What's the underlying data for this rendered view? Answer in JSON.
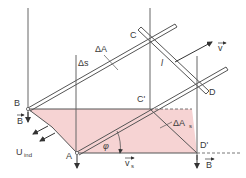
{
  "diagram": {
    "colors": {
      "line": "#555555",
      "area_fill": "#f6d3d3",
      "background": "#ffffff"
    },
    "labels": {
      "point_b": "B",
      "point_a": "A",
      "point_c": "C",
      "point_d": "D",
      "point_c_prime": "C'",
      "point_d_prime": "D'",
      "delta_a": "ΔA",
      "delta_s": "Δs",
      "delta_a_s": "ΔA",
      "delta_a_s_sub": "s",
      "length_l": "l",
      "velocity_v": "v",
      "velocity_vs": "v",
      "velocity_vs_sub": "s",
      "field_b_left": "B",
      "field_b_right": "B",
      "u_ind": "U",
      "u_ind_sub": "ind",
      "angle_phi": "φ"
    }
  }
}
